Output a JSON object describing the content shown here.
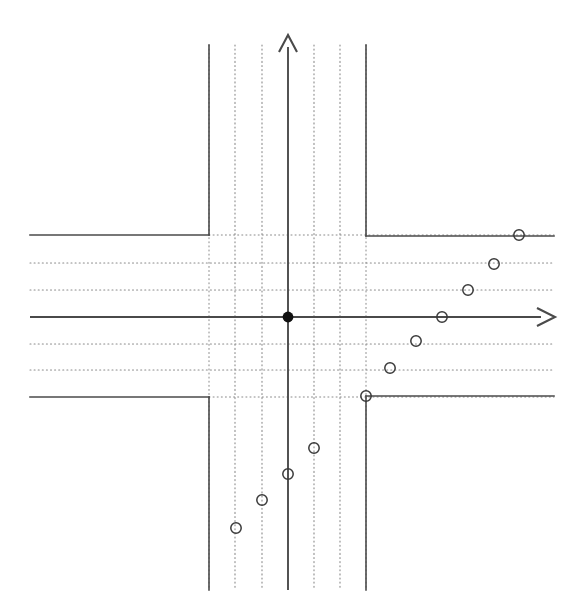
{
  "figure": {
    "width": 584,
    "height": 611,
    "background_color": "#ffffff",
    "axis_color": "#4a4a4a",
    "grid_color": "#8a8a8a",
    "marker_stroke_color": "#3a3a3a",
    "origin_fill_color": "#111111"
  },
  "chart_data": {
    "type": "scatter",
    "title": "",
    "subtitle": "",
    "xlabel": "",
    "ylabel": "",
    "grid": "dotted",
    "grid_style": "dotted",
    "legend": "none",
    "axis_arrows": [
      "x-positive",
      "y-positive"
    ],
    "xlim": [
      -3,
      10
    ],
    "ylim": [
      -10,
      3
    ],
    "x_tick_values": [
      -3,
      -2,
      -1,
      0,
      1,
      2,
      3
    ],
    "y_tick_values": [
      -3,
      -2,
      -1,
      0,
      1,
      2,
      3
    ],
    "tick_labels_shown": false,
    "origin_point": {
      "x": 0,
      "y": 0,
      "marker": "filled-circle",
      "label": "origin"
    },
    "series": [
      {
        "name": "data points",
        "marker": "open-circle",
        "x": [
          -2.0,
          -1.5,
          -1.0,
          -0.5,
          0.0,
          0.5,
          1.0,
          1.5,
          2.0,
          2.5,
          3.0,
          3.5
        ],
        "y": [
          -7.8,
          -7.0,
          -6.0,
          -5.0,
          -4.0,
          -3.0,
          -2.0,
          -1.0,
          0.0,
          1.0,
          2.0,
          3.0
        ],
        "pixel_points": [
          {
            "x": 236,
            "y": 528
          },
          {
            "x": 262,
            "y": 500
          },
          {
            "x": 288,
            "y": 474
          },
          {
            "x": 314,
            "y": 448
          },
          {
            "x": 366,
            "y": 396
          },
          {
            "x": 390,
            "y": 368
          },
          {
            "x": 416,
            "y": 341
          },
          {
            "x": 442,
            "y": 317
          },
          {
            "x": 468,
            "y": 290
          },
          {
            "x": 494,
            "y": 264
          },
          {
            "x": 519,
            "y": 235
          }
        ]
      }
    ],
    "step_curve": {
      "name": "step function",
      "description": "Piecewise constant staircase: upper-left horizontal ray, vertical riser at x=-3, vertical riser at x=3, lower-right horizontal ray",
      "segments": [
        {
          "type": "horizontal",
          "x1": 30,
          "x2": 209,
          "y": 235
        },
        {
          "type": "vertical",
          "x": 209,
          "y1": 45,
          "y2": 235
        },
        {
          "type": "vertical",
          "x": 366,
          "y1": 45,
          "y2": 236
        },
        {
          "type": "horizontal",
          "x1": 366,
          "x2": 554,
          "y": 236
        },
        {
          "type": "horizontal",
          "x1": 30,
          "x2": 209,
          "y": 397
        },
        {
          "type": "vertical",
          "x": 209,
          "y1": 397,
          "y2": 590
        },
        {
          "type": "vertical",
          "x": 366,
          "y1": 396,
          "y2": 590
        },
        {
          "type": "horizontal",
          "x1": 366,
          "x2": 554,
          "y": 396
        }
      ]
    },
    "gridlines": {
      "vertical_dotted_x": [
        235,
        262,
        314,
        340
      ],
      "horizontal_dotted_y": [
        263,
        290,
        344,
        370
      ],
      "vertical_dotted_extent": [
        45,
        590
      ],
      "horizontal_dotted_extent": [
        30,
        554
      ]
    },
    "axes": {
      "x_axis": {
        "y": 317,
        "x1": 30,
        "x2": 555,
        "arrow": "right"
      },
      "y_axis": {
        "x": 288,
        "y1": 35,
        "y2": 590,
        "arrow": "up"
      }
    }
  }
}
